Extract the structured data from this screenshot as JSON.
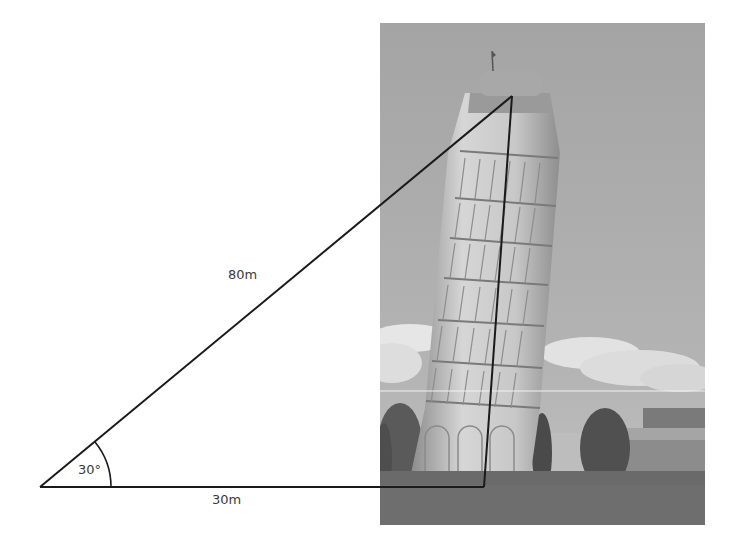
{
  "figure": {
    "type": "trigonometry diagram over photograph",
    "photo_subject": "Leaning Tower of Pisa (grayscale photograph)",
    "labels": {
      "hypotenuse": "80m",
      "base": "30m",
      "angle": "30°"
    },
    "geometry": {
      "left_vertex": [
        40,
        487
      ],
      "right_angle_vertex": [
        484,
        487
      ],
      "apex": [
        512,
        96
      ],
      "angle_arc_radius": 71
    },
    "colors": {
      "line": "#1a1a1a",
      "text": "#3a3a3a",
      "sky": "#a9a9a9",
      "ground": "#6e6e6e"
    }
  }
}
